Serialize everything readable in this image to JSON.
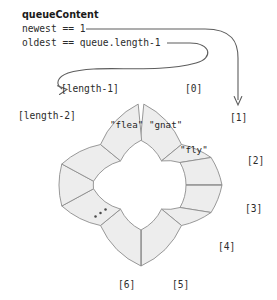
{
  "figure": {
    "title_label": "queueContent",
    "variables": [
      {
        "id": "newest",
        "text": "newest == 1",
        "points_to": "[1]"
      },
      {
        "id": "oldest",
        "text": "oldest == queue.length-1",
        "points_to": "[length-1]"
      }
    ],
    "colors": {
      "segment_fill": "#ededed",
      "segment_stroke": "#8d8d8d",
      "leader_stroke": "#5d5d5d",
      "text": "#1f1f1f",
      "background": "#ffffff"
    },
    "ellipsis": "...",
    "ring": {
      "type": "circular-queue",
      "center_x": 141,
      "center_y": 185,
      "outer_radius": 81,
      "inner_radius": 45,
      "segment_count": 12,
      "gap_at_top": true
    },
    "index_labels": [
      {
        "name": "zero",
        "text": "[0]"
      },
      {
        "name": "one",
        "text": "[1]"
      },
      {
        "name": "two",
        "text": "[2]"
      },
      {
        "name": "three",
        "text": "[3]"
      },
      {
        "name": "four",
        "text": "[4]"
      },
      {
        "name": "five",
        "text": "[5]"
      },
      {
        "name": "six",
        "text": "[6]"
      },
      {
        "name": "length-2",
        "text": "[length-2]"
      },
      {
        "name": "length-1",
        "text": "[length-1]"
      }
    ],
    "cell_values": [
      {
        "index": "[length-1]",
        "text": "\"flea\""
      },
      {
        "index": "[0]",
        "text": "\"gnat\""
      },
      {
        "index": "[1]",
        "text": "\"fly\""
      }
    ]
  }
}
